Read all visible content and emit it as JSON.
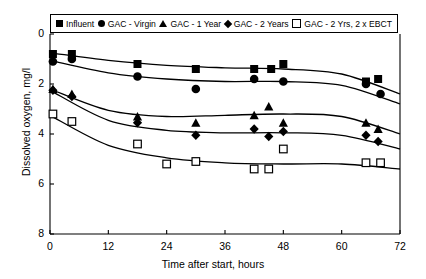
{
  "chart_data": {
    "type": "scatter",
    "title": "",
    "xlabel": "Time after start, hours",
    "ylabel": "Dissolved oxygen, mg/l",
    "xlim": [
      0,
      72
    ],
    "ylim": [
      0,
      8
    ],
    "xticks": [
      0,
      12,
      24,
      36,
      48,
      60,
      72
    ],
    "yticks": [
      0,
      2,
      4,
      6,
      8
    ],
    "grid": false,
    "legend_position": "top-inside",
    "series": [
      {
        "name": "Influent",
        "marker": "filled-square",
        "color": "#000000",
        "points": [
          {
            "x": 0.6,
            "y": 7.2
          },
          {
            "x": 4.5,
            "y": 7.2
          },
          {
            "x": 18.0,
            "y": 6.8
          },
          {
            "x": 30.0,
            "y": 6.6
          },
          {
            "x": 42.0,
            "y": 6.6
          },
          {
            "x": 45.5,
            "y": 6.6
          },
          {
            "x": 48.0,
            "y": 6.8
          },
          {
            "x": 65.0,
            "y": 6.1
          },
          {
            "x": 67.5,
            "y": 6.2
          }
        ],
        "trend": [
          {
            "x": 0,
            "y": 7.25
          },
          {
            "x": 12,
            "y": 6.95
          },
          {
            "x": 24,
            "y": 6.75
          },
          {
            "x": 36,
            "y": 6.65
          },
          {
            "x": 48,
            "y": 6.6
          },
          {
            "x": 60,
            "y": 6.4
          },
          {
            "x": 72,
            "y": 5.6
          }
        ]
      },
      {
        "name": "GAC - Virgin",
        "marker": "filled-circle",
        "color": "#000000",
        "points": [
          {
            "x": 0.6,
            "y": 6.9
          },
          {
            "x": 4.5,
            "y": 7.0
          },
          {
            "x": 18.0,
            "y": 6.3
          },
          {
            "x": 30.0,
            "y": 5.8
          },
          {
            "x": 42.0,
            "y": 6.2
          },
          {
            "x": 48.0,
            "y": 6.1
          },
          {
            "x": 65.0,
            "y": 6.0
          },
          {
            "x": 68.0,
            "y": 5.6
          }
        ],
        "trend": [
          {
            "x": 0,
            "y": 6.95
          },
          {
            "x": 12,
            "y": 6.45
          },
          {
            "x": 24,
            "y": 6.2
          },
          {
            "x": 36,
            "y": 6.1
          },
          {
            "x": 48,
            "y": 6.1
          },
          {
            "x": 60,
            "y": 5.95
          },
          {
            "x": 72,
            "y": 5.2
          }
        ]
      },
      {
        "name": "GAC - 1 Year",
        "marker": "filled-triangle",
        "color": "#000000",
        "points": [
          {
            "x": 0.6,
            "y": 5.8
          },
          {
            "x": 4.5,
            "y": 5.6
          },
          {
            "x": 18.0,
            "y": 4.7
          },
          {
            "x": 30.0,
            "y": 4.45
          },
          {
            "x": 42.0,
            "y": 4.75
          },
          {
            "x": 45.0,
            "y": 5.1
          },
          {
            "x": 48.0,
            "y": 4.45
          },
          {
            "x": 65.0,
            "y": 4.45
          },
          {
            "x": 67.5,
            "y": 4.2
          }
        ],
        "trend": [
          {
            "x": 0,
            "y": 5.8
          },
          {
            "x": 12,
            "y": 4.95
          },
          {
            "x": 24,
            "y": 4.7
          },
          {
            "x": 36,
            "y": 4.75
          },
          {
            "x": 48,
            "y": 4.8
          },
          {
            "x": 60,
            "y": 4.7
          },
          {
            "x": 72,
            "y": 4.0
          }
        ]
      },
      {
        "name": "GAC - 2 Years",
        "marker": "filled-diamond",
        "color": "#000000",
        "points": [
          {
            "x": 0.6,
            "y": 5.75
          },
          {
            "x": 4.5,
            "y": 5.5
          },
          {
            "x": 18.0,
            "y": 4.45
          },
          {
            "x": 30.0,
            "y": 3.95
          },
          {
            "x": 42.0,
            "y": 4.2
          },
          {
            "x": 45.0,
            "y": 3.9
          },
          {
            "x": 48.0,
            "y": 4.1
          },
          {
            "x": 65.0,
            "y": 3.95
          },
          {
            "x": 67.5,
            "y": 3.7
          }
        ],
        "trend": [
          {
            "x": 0,
            "y": 5.75
          },
          {
            "x": 12,
            "y": 4.55
          },
          {
            "x": 24,
            "y": 4.15
          },
          {
            "x": 36,
            "y": 4.05
          },
          {
            "x": 48,
            "y": 4.05
          },
          {
            "x": 60,
            "y": 3.95
          },
          {
            "x": 72,
            "y": 3.4
          }
        ]
      },
      {
        "name": "GAC - 2 Yrs, 2 x EBCT",
        "marker": "open-square",
        "color": "#000000",
        "points": [
          {
            "x": 0.6,
            "y": 4.8
          },
          {
            "x": 4.5,
            "y": 4.5
          },
          {
            "x": 18.0,
            "y": 3.6
          },
          {
            "x": 24.0,
            "y": 2.8
          },
          {
            "x": 30.0,
            "y": 2.9
          },
          {
            "x": 42.0,
            "y": 2.6
          },
          {
            "x": 45.0,
            "y": 2.6
          },
          {
            "x": 48.0,
            "y": 3.4
          },
          {
            "x": 65.0,
            "y": 2.85
          },
          {
            "x": 68.0,
            "y": 2.85
          }
        ],
        "trend": [
          {
            "x": 0,
            "y": 4.75
          },
          {
            "x": 12,
            "y": 3.55
          },
          {
            "x": 24,
            "y": 3.05
          },
          {
            "x": 36,
            "y": 2.85
          },
          {
            "x": 48,
            "y": 2.8
          },
          {
            "x": 60,
            "y": 2.8
          },
          {
            "x": 72,
            "y": 2.6
          }
        ]
      }
    ]
  },
  "axes": {
    "ylabel": "Dissolved oxygen, mg/l",
    "xlabel": "Time after start, hours",
    "yticks": [
      "8",
      "6",
      "4",
      "2",
      "0"
    ],
    "xticks": [
      "0",
      "12",
      "24",
      "36",
      "48",
      "60",
      "72"
    ]
  },
  "legend": {
    "items": [
      {
        "label": "Influent",
        "marker": "filled-square"
      },
      {
        "label": "GAC - Virgin",
        "marker": "filled-circle"
      },
      {
        "label": "GAC - 1 Year",
        "marker": "filled-triangle"
      },
      {
        "label": "GAC - 2 Years",
        "marker": "filled-diamond"
      },
      {
        "label": "GAC - 2 Yrs, 2 x EBCT",
        "marker": "open-square"
      }
    ]
  }
}
